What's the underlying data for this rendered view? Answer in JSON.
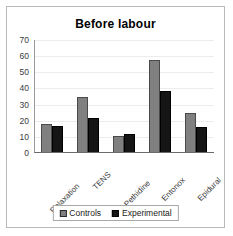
{
  "chart_data": {
    "type": "bar",
    "title": "Before labour",
    "xlabel": "",
    "ylabel": "",
    "ylim": [
      0,
      70
    ],
    "yticks": [
      0,
      10,
      20,
      30,
      40,
      50,
      60,
      70
    ],
    "grid": true,
    "legend_position": "bottom",
    "categories": [
      "Relaxation",
      "TENS",
      "Pethidine",
      "Entonox",
      "Epidural"
    ],
    "series": [
      {
        "name": "Controls",
        "color": "#808080",
        "values": [
          18,
          34.5,
          10.5,
          57.5,
          24.5
        ]
      },
      {
        "name": "Experimental",
        "color": "#151515",
        "values": [
          16.5,
          21.5,
          11.5,
          38.5,
          16
        ]
      }
    ]
  },
  "legend": {
    "items": [
      {
        "label": "Controls",
        "swatch": "controls-swatch-icon"
      },
      {
        "label": "Experimental",
        "swatch": "experimental-swatch-icon"
      }
    ]
  }
}
